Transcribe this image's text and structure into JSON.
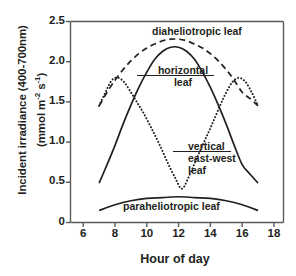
{
  "chart_data": {
    "type": "line",
    "title": "",
    "xlabel": "Hour of day",
    "ylabel_line1": "Incident irradiance (400-700nm)",
    "ylabel_line2": "(mmol m-2 s-1)",
    "xlim": [
      5.2,
      18.6
    ],
    "ylim": [
      0,
      2.5
    ],
    "xticks": [
      "6",
      "8",
      "10",
      "12",
      "14",
      "16",
      "18"
    ],
    "xtick_values": [
      6,
      8,
      10,
      12,
      14,
      16,
      18
    ],
    "yticks": [
      "0",
      "0.5",
      "1.0",
      "1.5",
      "2.0",
      "2.5"
    ],
    "ytick_values": [
      0,
      0.5,
      1.0,
      1.5,
      2.0,
      2.5
    ],
    "grid": false,
    "legend": "in-plot annotations",
    "series": [
      {
        "name": "diaheliotropic leaf",
        "style": "dashed",
        "color": "#231f20",
        "x": [
          7.0,
          7.5,
          8.0,
          8.5,
          9.0,
          9.5,
          10.0,
          10.5,
          11.0,
          11.5,
          12.0,
          12.5,
          13.0,
          13.5,
          14.0,
          14.5,
          15.0,
          15.5,
          16.0,
          16.5,
          17.0
        ],
        "y": [
          1.45,
          1.62,
          1.77,
          1.9,
          2.01,
          2.1,
          2.17,
          2.22,
          2.26,
          2.28,
          2.28,
          2.26,
          2.22,
          2.17,
          2.1,
          2.01,
          1.9,
          1.77,
          1.62,
          1.54,
          1.45
        ]
      },
      {
        "name": "horizontal leaf",
        "style": "solid",
        "color": "#231f20",
        "x": [
          7.0,
          7.5,
          8.0,
          8.5,
          9.0,
          9.5,
          10.0,
          10.5,
          11.0,
          11.5,
          12.0,
          12.5,
          13.0,
          13.5,
          14.0,
          14.5,
          15.0,
          15.5,
          16.0,
          16.5,
          17.0
        ],
        "y": [
          0.49,
          0.72,
          0.96,
          1.22,
          1.46,
          1.68,
          1.87,
          2.03,
          2.13,
          2.18,
          2.18,
          2.13,
          2.03,
          1.87,
          1.68,
          1.46,
          1.22,
          0.96,
          0.72,
          0.6,
          0.49
        ]
      },
      {
        "name": "vertical east-west leaf",
        "style": "dotted",
        "color": "#231f20",
        "x": [
          7.0,
          7.4,
          7.8,
          8.2,
          8.6,
          9.0,
          9.4,
          9.8,
          10.3,
          10.8,
          11.3,
          11.8,
          12.2,
          12.6,
          13.1,
          13.6,
          14.1,
          14.6,
          15.0,
          15.4,
          15.8,
          16.2,
          16.6,
          17.0
        ],
        "y": [
          1.45,
          1.62,
          1.77,
          1.8,
          1.74,
          1.62,
          1.49,
          1.36,
          1.17,
          0.97,
          0.75,
          0.55,
          0.42,
          0.55,
          0.78,
          1.0,
          1.22,
          1.45,
          1.62,
          1.75,
          1.8,
          1.75,
          1.62,
          1.45
        ]
      },
      {
        "name": "paraheliotropic leaf",
        "style": "solid",
        "color": "#231f20",
        "x": [
          7.0,
          8.0,
          9.0,
          10.0,
          11.0,
          12.0,
          13.0,
          14.0,
          15.0,
          16.0,
          17.0
        ],
        "y": [
          0.15,
          0.22,
          0.27,
          0.3,
          0.31,
          0.32,
          0.31,
          0.3,
          0.27,
          0.22,
          0.15
        ]
      }
    ],
    "annotations": [
      {
        "id": "dia",
        "text": "diaheliotropic leaf"
      },
      {
        "id": "hor_line1",
        "text": "horizontal"
      },
      {
        "id": "hor_line2",
        "text": "leaf"
      },
      {
        "id": "ver_line1",
        "text": "vertical"
      },
      {
        "id": "ver_line2",
        "text": "east-west"
      },
      {
        "id": "ver_line3",
        "text": "leaf"
      },
      {
        "id": "par",
        "text": "paraheliotropic leaf"
      }
    ]
  },
  "axes": {
    "frame_color": "#58595b"
  }
}
